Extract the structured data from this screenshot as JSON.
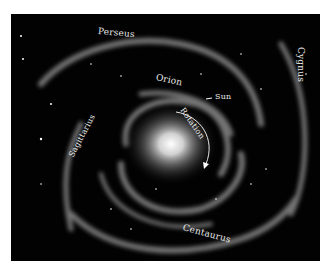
{
  "figure": {
    "background_color": "#020202",
    "labels": {
      "perseus": "Perseus",
      "cygnus": "Cygnus",
      "orion": "Orion",
      "sun": "Sun",
      "sagittarius": "Sagittarius",
      "rotation": "Rotation",
      "centaurus": "Centaurus"
    }
  }
}
